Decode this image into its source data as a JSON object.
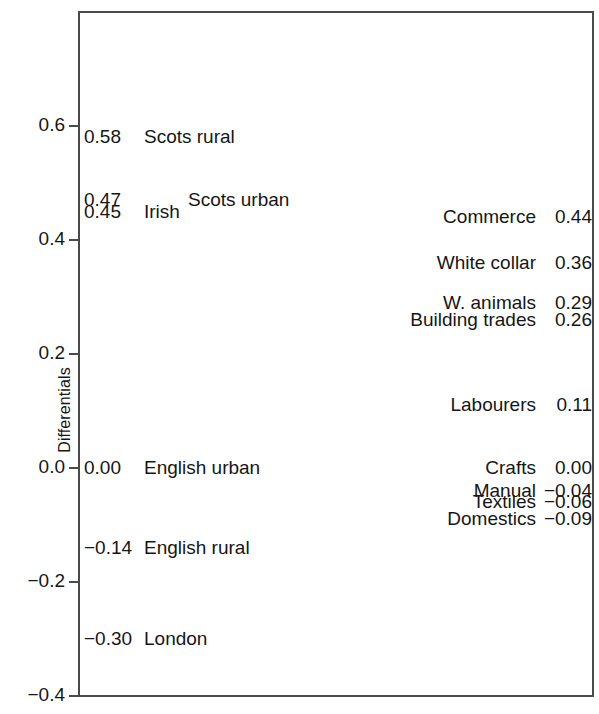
{
  "chart_data": {
    "type": "scatter",
    "title": "",
    "xlabel": "",
    "ylabel": "Differentials",
    "ylim": [
      -0.4,
      0.7
    ],
    "yticks": [
      0.6,
      0.4,
      0.2,
      0.0,
      -0.2,
      -0.4
    ],
    "ytick_labels": [
      "0.6",
      "0.4",
      "0.2",
      "0.0",
      "−0.2",
      "−0.4"
    ],
    "grid": false,
    "legend": null,
    "note": "Two label columns of annotated differential values; no plotted markers, values shown as text at their vertical position.",
    "series": [
      {
        "name": "Regional differentials",
        "side": "left",
        "points": [
          {
            "label": "Scots rural",
            "value": 0.58,
            "value_text": "0.58",
            "indent": 0
          },
          {
            "label": "Scots urban",
            "value": 0.47,
            "value_text": "0.47",
            "indent": 1
          },
          {
            "label": "Irish",
            "value": 0.45,
            "value_text": "0.45",
            "indent": 0
          },
          {
            "label": "English urban",
            "value": 0.0,
            "value_text": "0.00",
            "indent": 0
          },
          {
            "label": "English rural",
            "value": -0.14,
            "value_text": "−0.14",
            "indent": 0
          },
          {
            "label": "London",
            "value": -0.3,
            "value_text": "−0.30",
            "indent": 0
          }
        ]
      },
      {
        "name": "Occupational differentials",
        "side": "right",
        "points": [
          {
            "label": "Commerce",
            "value": 0.44,
            "value_text": "0.44"
          },
          {
            "label": "White collar",
            "value": 0.36,
            "value_text": "0.36"
          },
          {
            "label": "W. animals",
            "value": 0.29,
            "value_text": "0.29"
          },
          {
            "label": "Building trades",
            "value": 0.26,
            "value_text": "0.26"
          },
          {
            "label": "Labourers",
            "value": 0.11,
            "value_text": "0.11"
          },
          {
            "label": "Crafts",
            "value": 0.0,
            "value_text": "0.00"
          },
          {
            "label": "Manual",
            "value": -0.04,
            "value_text": "−0.04"
          },
          {
            "label": "Textiles",
            "value": -0.06,
            "value_text": "−0.06"
          },
          {
            "label": "Domestics",
            "value": -0.09,
            "value_text": "−0.09"
          }
        ]
      }
    ]
  },
  "axis": {
    "y_title": "Differentials",
    "ticks": [
      {
        "label": "0.6",
        "value": 0.6
      },
      {
        "label": "0.4",
        "value": 0.4
      },
      {
        "label": "0.2",
        "value": 0.2
      },
      {
        "label": "0.0",
        "value": 0.0
      },
      {
        "label": "−0.2",
        "value": -0.2
      },
      {
        "label": "−0.4",
        "value": -0.4
      }
    ]
  },
  "colors": {
    "text": "#161616",
    "axis": "#4a4a4a",
    "background": "#ffffff"
  }
}
